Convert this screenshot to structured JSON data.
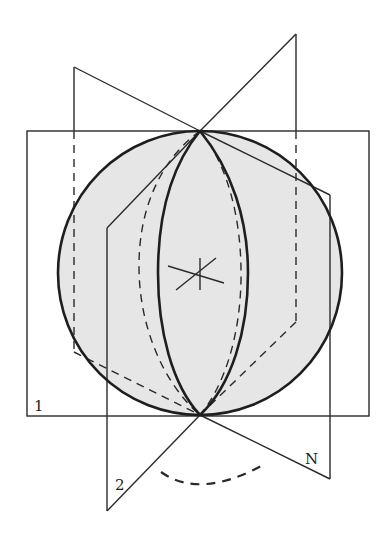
{
  "diagram": {
    "labels": {
      "plane1": "1",
      "plane2": "2",
      "planeN": "N"
    },
    "colors": {
      "sphere_fill": "#e6e6e6",
      "stroke": "#1e1e1e",
      "background": "#ffffff"
    },
    "sphere": {
      "cx": 200,
      "cy": 273,
      "r": 142
    },
    "poles": {
      "top": [
        200,
        131
      ],
      "bottom": [
        200,
        415
      ]
    },
    "center_mark": "axis-cross"
  }
}
